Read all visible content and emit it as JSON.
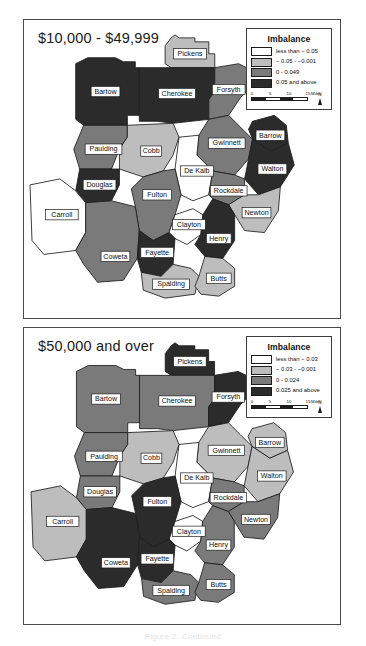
{
  "figure": {
    "caption": "Figure 2. Continued"
  },
  "palette": {
    "c1_white": "#ffffff",
    "c2_light": "#bdbdbd",
    "c3_medium": "#7a7a7a",
    "c4_dark": "#2b2b2b",
    "outline": "#1c1c1c",
    "frame": "#4a4a4a"
  },
  "panels": [
    {
      "id": "panel-top",
      "title": "$10,000 - $49,999",
      "legend": {
        "title": "Imbalance",
        "entries": [
          {
            "label": "less than − 0.05",
            "class": 1
          },
          {
            "label": "− 0.05 - −0.001",
            "class": 2
          },
          {
            "label": "0 - 0.049",
            "class": 3
          },
          {
            "label": "0.05 and above",
            "class": 4
          }
        ],
        "scalebar": {
          "ticks": [
            "0",
            "5",
            "10",
            "15"
          ],
          "units": "Miles"
        },
        "north_label": "N"
      },
      "counties": [
        {
          "name": "Pickens",
          "class": 2
        },
        {
          "name": "Bartow",
          "class": 4
        },
        {
          "name": "Cherokee",
          "class": 4
        },
        {
          "name": "Forsyth",
          "class": 3
        },
        {
          "name": "Paulding",
          "class": 3
        },
        {
          "name": "Cobb",
          "class": 2
        },
        {
          "name": "Gwinnett",
          "class": 3
        },
        {
          "name": "Barrow",
          "class": 4
        },
        {
          "name": "Walton",
          "class": 4
        },
        {
          "name": "De Kalb",
          "class": 1
        },
        {
          "name": "Douglas",
          "class": 4
        },
        {
          "name": "Fulton",
          "class": 3
        },
        {
          "name": "Rockdale",
          "class": 3
        },
        {
          "name": "Newton",
          "class": 2
        },
        {
          "name": "Carroll",
          "class": 1
        },
        {
          "name": "Clayton",
          "class": 1
        },
        {
          "name": "Henry",
          "class": 4
        },
        {
          "name": "Coweta",
          "class": 3
        },
        {
          "name": "Fayette",
          "class": 4
        },
        {
          "name": "Spalding",
          "class": 2
        },
        {
          "name": "Butts",
          "class": 2
        }
      ]
    },
    {
      "id": "panel-bottom",
      "title": "$50,000 and over",
      "legend": {
        "title": "Imbalance",
        "entries": [
          {
            "label": "less than − 0.03",
            "class": 1
          },
          {
            "label": "− 0.03 - −0.001",
            "class": 2
          },
          {
            "label": "0 - 0.024",
            "class": 3
          },
          {
            "label": "0.025 and above",
            "class": 4
          }
        ],
        "scalebar": {
          "ticks": [
            "0",
            "5",
            "10",
            "15"
          ],
          "units": "Miles"
        },
        "north_label": "N"
      },
      "counties": [
        {
          "name": "Pickens",
          "class": 4
        },
        {
          "name": "Bartow",
          "class": 3
        },
        {
          "name": "Cherokee",
          "class": 3
        },
        {
          "name": "Forsyth",
          "class": 4
        },
        {
          "name": "Paulding",
          "class": 3
        },
        {
          "name": "Cobb",
          "class": 2
        },
        {
          "name": "Gwinnett",
          "class": 2
        },
        {
          "name": "Barrow",
          "class": 2
        },
        {
          "name": "Walton",
          "class": 2
        },
        {
          "name": "De Kalb",
          "class": 1
        },
        {
          "name": "Douglas",
          "class": 3
        },
        {
          "name": "Fulton",
          "class": 4
        },
        {
          "name": "Rockdale",
          "class": 3
        },
        {
          "name": "Newton",
          "class": 3
        },
        {
          "name": "Carroll",
          "class": 2
        },
        {
          "name": "Clayton",
          "class": 1
        },
        {
          "name": "Henry",
          "class": 3
        },
        {
          "name": "Coweta",
          "class": 4
        },
        {
          "name": "Fayette",
          "class": 4
        },
        {
          "name": "Spalding",
          "class": 3
        },
        {
          "name": "Butts",
          "class": 3
        }
      ]
    }
  ],
  "geometry": {
    "viewbox": "0 0 318 300",
    "counties": {
      "Pickens": {
        "path": "M148,18 L152,15 L156,18 L172,18 L172,22 L186,22 L186,34 L192,34 L192,48 L148,48 L142,44 L142,26 Z",
        "lx": 167,
        "ly": 34
      },
      "Bartow": {
        "path": "M52,44 L64,38 L92,38 L100,42 L112,42 L112,48 L116,48 L116,96 L104,96 L104,106 L60,106 L52,100 Z",
        "lx": 82,
        "ly": 72
      },
      "Cherokee": {
        "path": "M116,48 L142,48 L148,48 L192,48 L192,72 L186,80 L186,100 L150,104 L134,102 L116,102 Z",
        "lx": 154,
        "ly": 74
      },
      "Forsyth": {
        "path": "M192,48 L216,44 L232,52 L230,66 L218,78 L206,96 L186,100 L186,80 L192,72 Z",
        "lx": 206,
        "ly": 70
      },
      "Paulding": {
        "path": "M60,106 L104,106 L104,118 L96,130 L88,150 L56,150 L50,130 Z",
        "lx": 80,
        "ly": 130
      },
      "Cobb": {
        "path": "M104,106 L150,104 L156,118 L150,136 L140,152 L120,158 L96,150 L96,130 L104,118 Z",
        "lx": 128,
        "ly": 132
      },
      "Gwinnett": {
        "path": "M186,100 L206,96 L218,108 L230,120 L226,140 L212,156 L190,152 L174,136 L176,116 Z",
        "lx": 204,
        "ly": 124
      },
      "Barrow": {
        "path": "M230,102 L252,96 L264,106 L266,124 L248,132 L230,120 L226,110 Z",
        "lx": 248,
        "ly": 116
      },
      "Walton": {
        "path": "M230,120 L248,132 L266,124 L272,146 L258,168 L236,176 L222,160 L226,140 Z",
        "lx": 250,
        "ly": 150
      },
      "De Kalb": {
        "path": "M156,118 L176,116 L174,136 L190,152 L186,176 L170,182 L158,176 L152,150 Z",
        "lx": 174,
        "ly": 152
      },
      "Douglas": {
        "path": "M56,150 L88,150 L96,150 L96,166 L88,182 L62,184 L52,172 Z",
        "lx": 76,
        "ly": 166
      },
      "Fulton": {
        "path": "M120,158 L140,152 L152,150 L158,176 L152,196 L146,214 L130,222 L116,212 L112,188 L108,170 Z",
        "lx": 134,
        "ly": 176
      },
      "Rockdale": {
        "path": "M190,152 L212,156 L222,160 L222,176 L206,186 L190,180 L186,176 Z",
        "lx": 206,
        "ly": 172
      },
      "Newton": {
        "path": "M222,176 L236,176 L258,168 L256,192 L242,214 L222,212 L212,196 L206,186 Z",
        "lx": 234,
        "ly": 194
      },
      "Carroll": {
        "path": "M6,166 L36,160 L52,172 L62,184 L62,214 L52,232 L20,236 L8,222 Z",
        "lx": 38,
        "ly": 196
      },
      "Clayton": {
        "path": "M152,196 L170,190 L180,196 L178,216 L164,226 L152,220 L146,214 Z",
        "lx": 166,
        "ly": 206
      },
      "Henry": {
        "path": "M180,196 L190,180 L206,186 L212,196 L212,222 L200,240 L182,238 L172,226 L178,216 Z",
        "lx": 196,
        "ly": 220
      },
      "Coweta": {
        "path": "M62,214 L62,184 L88,182 L112,188 L116,212 L114,240 L100,262 L74,264 L60,246 L52,232 Z",
        "lx": 92,
        "ly": 238
      },
      "Fayette": {
        "path": "M116,212 L130,222 L146,214 L152,220 L150,246 L138,258 L118,254 L114,240 Z",
        "lx": 134,
        "ly": 234
      },
      "Spalding": {
        "path": "M118,254 L138,258 L150,246 L168,250 L176,258 L172,276 L142,280 L120,272 Z",
        "lx": 148,
        "ly": 266
      },
      "Butts": {
        "path": "M176,258 L182,238 L200,240 L212,250 L212,268 L196,278 L178,276 L172,268 Z",
        "lx": 196,
        "ly": 260
      }
    }
  }
}
